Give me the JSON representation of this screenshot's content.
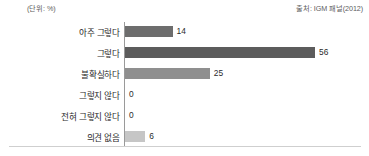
{
  "header": {
    "unit_note": "(단위: %)",
    "source_note": "출처: IGM 패널(2012)"
  },
  "chart_data": {
    "type": "bar",
    "orientation": "horizontal",
    "title": "",
    "subtitle": "",
    "xlabel": "",
    "ylabel": "",
    "unit": "%",
    "source": "출처: IGM 패널(2012)",
    "grid": false,
    "legend": false,
    "xlim": [
      0,
      60
    ],
    "categories": [
      "아주 그렇다",
      "그렇다",
      "불확실하다",
      "그렇지 않다",
      "전혀 그렇지 않다",
      "의견 없음"
    ],
    "values": [
      14,
      56,
      25,
      0,
      0,
      6
    ],
    "value_labels": [
      "14",
      "56",
      "25",
      "0",
      "0",
      "6"
    ],
    "bar_colors": [
      "#6d6d6d",
      "#5c5c5c",
      "#8f8f8f",
      "#b8b8b8",
      "#b8b8b8",
      "#c6c6c6"
    ]
  },
  "colors": {
    "axis": "#9a9a9a",
    "baseline": "#cfcfcf",
    "text": "#2b2b2b",
    "note_text": "#5d5d5d",
    "background": "#ffffff"
  }
}
